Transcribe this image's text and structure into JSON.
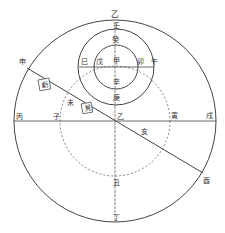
{
  "diagram": {
    "labels": {
      "outer_top": "乙",
      "ren": "壬",
      "gui": "癸",
      "jia": "甲",
      "xin": "辛",
      "geng": "庚",
      "si": "巳",
      "wu_inner": "戊",
      "mao": "卯",
      "wu_right": "午",
      "shen": "申",
      "bing": "丙",
      "zi": "子",
      "center": "乙",
      "yin": "寅",
      "xu": "戌",
      "wei": "未",
      "hai": "亥",
      "you": "酉",
      "chou": "丑",
      "ding": "丁",
      "box_kui": "虧",
      "box_jian": "見"
    }
  }
}
